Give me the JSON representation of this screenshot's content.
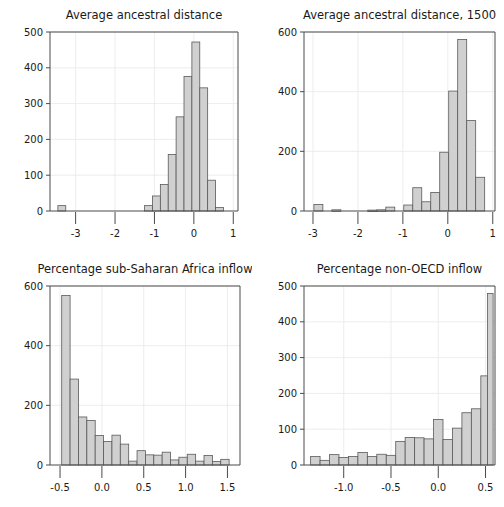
{
  "figure": {
    "width": 504,
    "height": 507,
    "background": "#ffffff",
    "bar_fill": "#d0d0d0",
    "bar_stroke": "#5a5a5a",
    "axis_color": "#4a4a4a",
    "grid_color": "#e8e8e8",
    "layout": "2x2 grid of histogram panels"
  },
  "chart_data": [
    {
      "type": "bar",
      "panel": "top-left",
      "title": "Average ancestral distance",
      "xlabel": "",
      "ylabel": "",
      "xlim": [
        -3.65,
        1.12
      ],
      "ylim": [
        0,
        500
      ],
      "xticks": [
        -3,
        -2,
        -1,
        0,
        1
      ],
      "xtick_labels": [
        "-3",
        "-2",
        "-1",
        "0",
        "1"
      ],
      "yticks": [
        0,
        100,
        200,
        300,
        400,
        500
      ],
      "ytick_labels": [
        "0",
        "100",
        "200",
        "300",
        "400",
        "500"
      ],
      "grid": true,
      "bin_width": 0.2,
      "bins": [
        {
          "x0": -3.45,
          "x1": -3.25,
          "value": 15
        },
        {
          "x0": -1.25,
          "x1": -1.05,
          "value": 15
        },
        {
          "x0": -1.05,
          "x1": -0.85,
          "value": 42
        },
        {
          "x0": -0.85,
          "x1": -0.65,
          "value": 74
        },
        {
          "x0": -0.65,
          "x1": -0.45,
          "value": 158
        },
        {
          "x0": -0.45,
          "x1": -0.25,
          "value": 263
        },
        {
          "x0": -0.25,
          "x1": -0.05,
          "value": 376
        },
        {
          "x0": -0.05,
          "x1": 0.15,
          "value": 472
        },
        {
          "x0": 0.15,
          "x1": 0.35,
          "value": 344
        },
        {
          "x0": 0.35,
          "x1": 0.55,
          "value": 86
        },
        {
          "x0": 0.55,
          "x1": 0.75,
          "value": 10
        }
      ]
    },
    {
      "type": "bar",
      "panel": "top-right",
      "title": "Average ancestral distance, 1500",
      "xlabel": "",
      "ylabel": "",
      "xlim": [
        -3.2,
        1.05
      ],
      "ylim": [
        0,
        600
      ],
      "xticks": [
        -3,
        -2,
        -1,
        0,
        1
      ],
      "xtick_labels": [
        "-3",
        "-2",
        "-1",
        "0",
        "1"
      ],
      "yticks": [
        0,
        200,
        400,
        600
      ],
      "ytick_labels": [
        "0",
        "200",
        "400",
        "600"
      ],
      "grid": true,
      "bin_width": 0.2,
      "bins": [
        {
          "x0": -2.98,
          "x1": -2.78,
          "value": 22
        },
        {
          "x0": -2.58,
          "x1": -2.38,
          "value": 4
        },
        {
          "x0": -1.78,
          "x1": -1.58,
          "value": 3
        },
        {
          "x0": -1.58,
          "x1": -1.38,
          "value": 4
        },
        {
          "x0": -1.38,
          "x1": -1.18,
          "value": 13
        },
        {
          "x0": -0.98,
          "x1": -0.78,
          "value": 20
        },
        {
          "x0": -0.78,
          "x1": -0.58,
          "value": 78
        },
        {
          "x0": -0.58,
          "x1": -0.38,
          "value": 31
        },
        {
          "x0": -0.38,
          "x1": -0.18,
          "value": 62
        },
        {
          "x0": -0.18,
          "x1": 0.02,
          "value": 197
        },
        {
          "x0": 0.02,
          "x1": 0.22,
          "value": 402
        },
        {
          "x0": 0.22,
          "x1": 0.42,
          "value": 575
        },
        {
          "x0": 0.42,
          "x1": 0.62,
          "value": 303
        },
        {
          "x0": 0.62,
          "x1": 0.82,
          "value": 113
        }
      ]
    },
    {
      "type": "bar",
      "panel": "bottom-left",
      "title": "Percentage sub-Saharan Africa inflow",
      "xlabel": "",
      "ylabel": "",
      "xlim": [
        -0.62,
        1.65
      ],
      "ylim": [
        0,
        600
      ],
      "xticks": [
        -0.5,
        0.0,
        0.5,
        1.0,
        1.5
      ],
      "xtick_labels": [
        "-0.5",
        "0.0",
        "0.5",
        "1.0",
        "1.5"
      ],
      "yticks": [
        0,
        200,
        400,
        600
      ],
      "ytick_labels": [
        "0",
        "200",
        "400",
        "600"
      ],
      "grid": true,
      "bin_width": 0.1,
      "bins": [
        {
          "x0": -0.48,
          "x1": -0.38,
          "value": 568
        },
        {
          "x0": -0.38,
          "x1": -0.28,
          "value": 288
        },
        {
          "x0": -0.28,
          "x1": -0.18,
          "value": 161
        },
        {
          "x0": -0.18,
          "x1": -0.08,
          "value": 149
        },
        {
          "x0": -0.08,
          "x1": 0.02,
          "value": 99
        },
        {
          "x0": 0.02,
          "x1": 0.12,
          "value": 79
        },
        {
          "x0": 0.12,
          "x1": 0.22,
          "value": 100
        },
        {
          "x0": 0.22,
          "x1": 0.32,
          "value": 70
        },
        {
          "x0": 0.32,
          "x1": 0.42,
          "value": 13
        },
        {
          "x0": 0.42,
          "x1": 0.52,
          "value": 48
        },
        {
          "x0": 0.52,
          "x1": 0.62,
          "value": 34
        },
        {
          "x0": 0.62,
          "x1": 0.72,
          "value": 33
        },
        {
          "x0": 0.72,
          "x1": 0.82,
          "value": 43
        },
        {
          "x0": 0.82,
          "x1": 0.92,
          "value": 17
        },
        {
          "x0": 0.92,
          "x1": 1.02,
          "value": 26
        },
        {
          "x0": 1.02,
          "x1": 1.12,
          "value": 36
        },
        {
          "x0": 1.12,
          "x1": 1.22,
          "value": 13
        },
        {
          "x0": 1.22,
          "x1": 1.32,
          "value": 32
        },
        {
          "x0": 1.32,
          "x1": 1.42,
          "value": 12
        },
        {
          "x0": 1.42,
          "x1": 1.52,
          "value": 19
        }
      ]
    },
    {
      "type": "bar",
      "panel": "bottom-right",
      "title": "Percentage non-OECD inflow",
      "xlabel": "",
      "ylabel": "",
      "xlim": [
        -1.42,
        0.6
      ],
      "ylim": [
        0,
        500
      ],
      "xticks": [
        -1.0,
        -0.5,
        0.0,
        0.5
      ],
      "xtick_labels": [
        "-1.0",
        "-0.5",
        "0.0",
        "0.5"
      ],
      "yticks": [
        0,
        100,
        200,
        300,
        400,
        500
      ],
      "ytick_labels": [
        "0",
        "100",
        "200",
        "300",
        "400",
        "500"
      ],
      "grid": true,
      "bin_width": 0.1,
      "bins": [
        {
          "x0": -1.35,
          "x1": -1.25,
          "value": 24
        },
        {
          "x0": -1.25,
          "x1": -1.15,
          "value": 13
        },
        {
          "x0": -1.15,
          "x1": -1.05,
          "value": 29
        },
        {
          "x0": -1.05,
          "x1": -0.95,
          "value": 21
        },
        {
          "x0": -0.95,
          "x1": -0.85,
          "value": 24
        },
        {
          "x0": -0.85,
          "x1": -0.75,
          "value": 35
        },
        {
          "x0": -0.75,
          "x1": -0.65,
          "value": 24
        },
        {
          "x0": -0.65,
          "x1": -0.55,
          "value": 30
        },
        {
          "x0": -0.55,
          "x1": -0.45,
          "value": 27
        },
        {
          "x0": -0.45,
          "x1": -0.35,
          "value": 66
        },
        {
          "x0": -0.35,
          "x1": -0.25,
          "value": 77
        },
        {
          "x0": -0.25,
          "x1": -0.15,
          "value": 76
        },
        {
          "x0": -0.15,
          "x1": -0.05,
          "value": 73
        },
        {
          "x0": -0.05,
          "x1": 0.05,
          "value": 127
        },
        {
          "x0": 0.05,
          "x1": 0.15,
          "value": 71
        },
        {
          "x0": 0.15,
          "x1": 0.25,
          "value": 103
        },
        {
          "x0": 0.25,
          "x1": 0.35,
          "value": 146
        },
        {
          "x0": 0.35,
          "x1": 0.45,
          "value": 157
        },
        {
          "x0": 0.45,
          "x1": 0.52,
          "value": 249
        },
        {
          "x0": 0.52,
          "x1": 0.58,
          "value": 479
        }
      ]
    }
  ]
}
